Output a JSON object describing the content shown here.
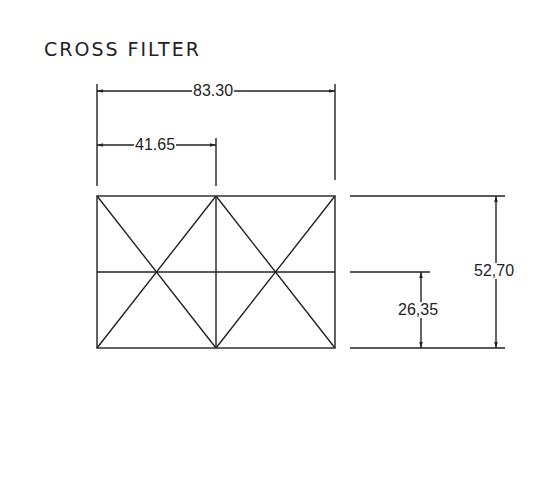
{
  "title": "CROSS FILTER",
  "dimensions": {
    "overall_width": "83.30",
    "half_width": "41.65",
    "overall_height": "52,70",
    "half_height": "26,35"
  },
  "colors": {
    "line": "#222222",
    "background": "#ffffff"
  }
}
